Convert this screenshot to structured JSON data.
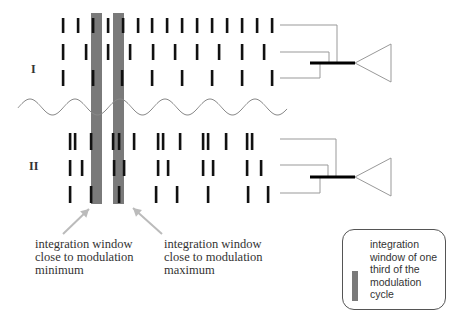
{
  "labels": {
    "group_I": "I",
    "group_II": "II"
  },
  "captions": {
    "minimum": "integration window\nclose to modulation\nminimum",
    "maximum": "integration window\nclose to modulation\nmaximum"
  },
  "legend": {
    "text": "integration\nwindow of one\nthird of the\nmodulation\ncycle",
    "swatch_color": "#7a7a7a"
  },
  "colors": {
    "spike": "#111111",
    "window": "#7a7a7a",
    "connector": "#999999",
    "sine": "#888888",
    "arrow": "#bbbbbb",
    "summing_bar": "#000000"
  },
  "integration_windows": [
    {
      "x": 91,
      "width": 11,
      "y_top": 13,
      "y_bottom": 204,
      "label": "minimum"
    },
    {
      "x": 113,
      "width": 11,
      "y_top": 13,
      "y_bottom": 204,
      "label": "maximum"
    }
  ],
  "sine_wave": {
    "x_start": 18,
    "x_end": 287,
    "y_center": 107,
    "amplitude": 8,
    "period": 45,
    "first_peak_x": 30
  },
  "group_I": {
    "rows": [
      {
        "y_top": 18,
        "y_bottom": 33,
        "spikes": [
          63,
          78,
          93,
          108,
          123,
          138,
          152,
          167,
          182,
          197,
          212,
          227,
          242,
          257,
          272
        ]
      },
      {
        "y_top": 44,
        "y_bottom": 60,
        "spikes": [
          63,
          86,
          108,
          130,
          153,
          175,
          197,
          219,
          242,
          264
        ]
      },
      {
        "y_top": 70,
        "y_bottom": 86,
        "spikes": [
          63,
          93,
          122,
          152,
          182,
          212,
          242,
          272
        ]
      }
    ],
    "connectors": [
      {
        "y": 25,
        "x_end": 337
      },
      {
        "y": 52,
        "x_end": 329
      },
      {
        "y": 78,
        "x_end": 320
      }
    ],
    "bus_y": 63,
    "neuron": {
      "tip_x": 355,
      "base_x": 391,
      "base_top": 44,
      "base_bottom": 82
    }
  },
  "group_II": {
    "rows": [
      {
        "y_top": 133,
        "y_bottom": 150,
        "spikes": [
          70,
          75,
          91,
          113,
          119,
          134,
          158,
          163,
          180,
          203,
          208,
          226,
          247,
          252
        ]
      },
      {
        "y_top": 160,
        "y_bottom": 176,
        "spikes": [
          70,
          82,
          114,
          124,
          158,
          168,
          203,
          213,
          247,
          261
        ]
      },
      {
        "y_top": 186,
        "y_bottom": 203,
        "spikes": [
          70,
          91,
          119,
          156,
          177,
          208,
          248,
          268
        ]
      }
    ],
    "connectors": [
      {
        "y": 139,
        "x_end": 336
      },
      {
        "y": 165,
        "x_end": 328
      },
      {
        "y": 193,
        "x_end": 320
      }
    ],
    "bus_y": 177,
    "neuron": {
      "tip_x": 355,
      "base_x": 391,
      "base_top": 158,
      "base_bottom": 196
    }
  },
  "arrows": [
    {
      "from": [
        63,
        234
      ],
      "to": [
        89,
        209
      ]
    },
    {
      "from": [
        162,
        234
      ],
      "to": [
        133,
        208
      ]
    }
  ]
}
